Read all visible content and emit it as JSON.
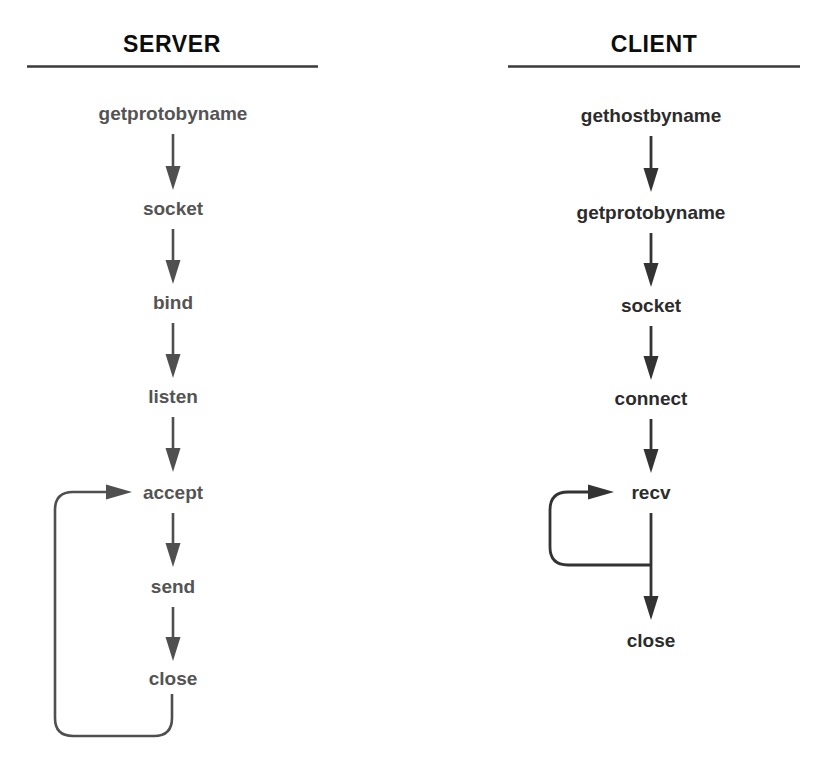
{
  "diagram": {
    "title_server": "SERVER",
    "title_client": "CLIENT",
    "colors": {
      "heading": "#0d0d0d",
      "rule": "#3a3a3a",
      "server_text": "#545454",
      "client_text": "#2c2c2c",
      "server_stroke": "#4f4f4f",
      "client_stroke": "#333333",
      "background": "#ffffff"
    },
    "columns": [
      {
        "name": "server",
        "heading": "SERVER",
        "steps": [
          {
            "label": "getprotobyname"
          },
          {
            "label": "socket"
          },
          {
            "label": "bind"
          },
          {
            "label": "listen"
          },
          {
            "label": "accept"
          },
          {
            "label": "send"
          },
          {
            "label": "close"
          }
        ],
        "loop": {
          "from": "close",
          "to": "accept",
          "description": "loop back from close to accept"
        }
      },
      {
        "name": "client",
        "heading": "CLIENT",
        "steps": [
          {
            "label": "gethostbyname"
          },
          {
            "label": "getprotobyname"
          },
          {
            "label": "socket"
          },
          {
            "label": "connect"
          },
          {
            "label": "recv"
          },
          {
            "label": "close"
          }
        ],
        "loop": {
          "from": "recv",
          "to": "recv",
          "description": "loop back from the recv-to-close link into recv"
        }
      }
    ]
  }
}
